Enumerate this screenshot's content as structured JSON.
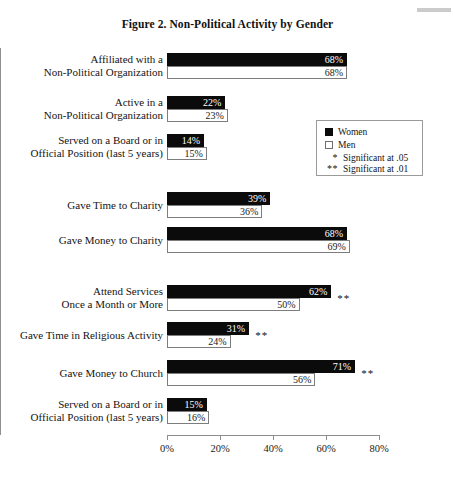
{
  "figure": {
    "title": "Figure 2. Non-Political Activity by Gender"
  },
  "legend": {
    "women_label": "Women",
    "men_label": "Men",
    "sig05_marker": "*",
    "sig05_label": "Significant at .05",
    "sig01_marker": "**",
    "sig01_label": "Significant at .01"
  },
  "axis": {
    "ticks": [
      "0%",
      "20%",
      "40%",
      "60%",
      "80%"
    ],
    "tick_values": [
      0,
      20,
      40,
      60,
      80
    ]
  },
  "chart_data": {
    "type": "bar",
    "orientation": "horizontal",
    "title": "Figure 2. Non-Political Activity by Gender",
    "xlabel": "",
    "ylabel": "",
    "xlim": [
      0,
      80
    ],
    "grid": false,
    "legend_position": "right",
    "categories": [
      "Affiliated with a Non-Political Organization",
      "Active in a Non-Political Organization",
      "Served on a Board or in Official Position (last 5 years)",
      "Gave Time to Charity",
      "Gave Money to Charity",
      "Attend Services Once a Month or More",
      "Gave Time in Religious Activity",
      "Gave Money to Church",
      "Served on a Board or in Official Position (last 5 years)"
    ],
    "series": [
      {
        "name": "Women",
        "color": "#0b0b0b",
        "values": [
          68,
          22,
          14,
          39,
          68,
          62,
          31,
          71,
          15
        ],
        "labels": [
          "68%",
          "22%",
          "14%",
          "39%",
          "68%",
          "62%",
          "31%",
          "71%",
          "15%"
        ]
      },
      {
        "name": "Men",
        "color": "#ffffff",
        "values": [
          68,
          23,
          15,
          36,
          69,
          50,
          24,
          56,
          16
        ],
        "labels": [
          "68%",
          "23%",
          "15%",
          "36%",
          "69%",
          "50%",
          "24%",
          "56%",
          "16%"
        ]
      }
    ],
    "significance": [
      "",
      "",
      "",
      "",
      "",
      "**",
      "**",
      "**",
      ""
    ]
  },
  "rows": [
    {
      "label_line1": "Affiliated with a",
      "label_line2": "Non-Political Organization",
      "women_label": "68%",
      "men_label": "68%",
      "significance": ""
    },
    {
      "label_line1": "Active in a",
      "label_line2": "Non-Political Organization",
      "women_label": "22%",
      "men_label": "23%",
      "significance": ""
    },
    {
      "label_line1": "Served on a Board or in",
      "label_line2": "Official Position (last 5 years)",
      "women_label": "14%",
      "men_label": "15%",
      "significance": ""
    },
    {
      "label_line1": "Gave Time to Charity",
      "label_line2": "",
      "women_label": "39%",
      "men_label": "36%",
      "significance": ""
    },
    {
      "label_line1": "Gave Money to Charity",
      "label_line2": "",
      "women_label": "68%",
      "men_label": "69%",
      "significance": ""
    },
    {
      "label_line1": "Attend Services",
      "label_line2": "Once a Month or More",
      "women_label": "62%",
      "men_label": "50%",
      "significance": "**"
    },
    {
      "label_line1": "Gave Time in Religious Activity",
      "label_line2": "",
      "women_label": "31%",
      "men_label": "24%",
      "significance": "**"
    },
    {
      "label_line1": "Gave Money to Church",
      "label_line2": "",
      "women_label": "71%",
      "men_label": "56%",
      "significance": "**"
    },
    {
      "label_line1": "Served on a Board or in",
      "label_line2": "Official Position (last 5 years)",
      "women_label": "15%",
      "men_label": "16%",
      "significance": ""
    }
  ]
}
